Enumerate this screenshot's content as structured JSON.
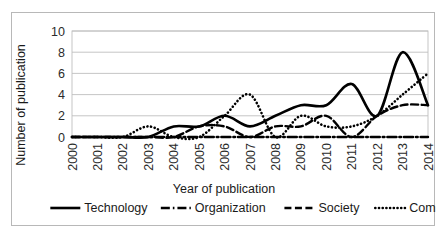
{
  "chart_data": {
    "type": "line",
    "title": "",
    "xlabel": "Year of publication",
    "ylabel": "Number of publication",
    "categories": [
      "2000",
      "2001",
      "2002",
      "2003",
      "2004",
      "2005",
      "2006",
      "2007",
      "2008",
      "2009",
      "2010",
      "2011",
      "2012",
      "2013",
      "2014"
    ],
    "x": [
      2000,
      2001,
      2002,
      2003,
      2004,
      2005,
      2006,
      2007,
      2008,
      2009,
      2010,
      2011,
      2012,
      2013,
      2014
    ],
    "xlim": [
      2000,
      2014
    ],
    "ylim": [
      0,
      10
    ],
    "yticks": [
      0,
      2,
      4,
      6,
      8,
      10
    ],
    "ytick_labels": [
      "0",
      "2",
      "4",
      "6",
      "8",
      "10"
    ],
    "grid": "horizontal",
    "smoothed": true,
    "legend_position": "bottom",
    "series": [
      {
        "name": "Technology",
        "style": "solid",
        "color": "#000000",
        "values": [
          0,
          0,
          0,
          0,
          1,
          1,
          2,
          1,
          2,
          3,
          3,
          5,
          2,
          8,
          3
        ]
      },
      {
        "name": "Organization",
        "style": "dash-dot",
        "color": "#000000",
        "values": [
          0,
          0,
          0,
          0,
          0,
          0,
          0,
          0,
          0,
          0,
          0,
          0,
          0,
          0,
          0
        ]
      },
      {
        "name": "Society",
        "style": "dashed",
        "color": "#000000",
        "values": [
          0,
          0,
          0,
          0,
          0,
          1,
          1,
          0,
          1,
          1,
          2,
          0,
          2,
          3,
          3
        ]
      },
      {
        "name": "Combined",
        "style": "dotted",
        "color": "#000000",
        "values": [
          0,
          0,
          0,
          1,
          0,
          0,
          2,
          4,
          0,
          2,
          1,
          1,
          2,
          4,
          6
        ]
      }
    ]
  },
  "legend": {
    "items": [
      {
        "label": "Technology",
        "style": "solid"
      },
      {
        "label": "Organization",
        "style": "dash-dot"
      },
      {
        "label": "Society",
        "style": "dashed"
      },
      {
        "label": "Combined",
        "style": "dotted"
      }
    ]
  },
  "axes": {
    "y_title": "Number of publication",
    "x_title": "Year of publication"
  }
}
